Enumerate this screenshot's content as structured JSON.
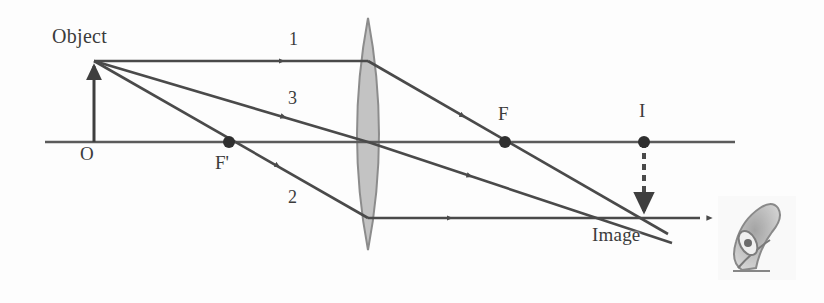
{
  "figure": {
    "background_color": "#fdfdfd",
    "ink_color": "#4a4a4a",
    "lens_fill_color": "#b8b8b8"
  },
  "labels": {
    "object": "Object",
    "optical_center": "O",
    "near_focal_point": "F'",
    "far_focal_point": "F",
    "image_point_on_axis": "I",
    "image": "Image",
    "ray1": "1",
    "ray2": "2",
    "ray3": "3"
  },
  "geometry": {
    "principal_axis": {
      "x1": 45,
      "y1": 142,
      "x2": 735,
      "y2": 142
    },
    "object_arrow": {
      "x": 94,
      "base_y": 142,
      "tip_y": 61
    },
    "image_arrow": {
      "x": 644,
      "base_y": 142,
      "tip_y": 216,
      "style": "dashed"
    },
    "lens": {
      "center_x": 368,
      "top_y": 18,
      "bottom_y": 250,
      "half_width": 22
    },
    "points": [
      {
        "name": "O",
        "x": 94,
        "y": 142
      },
      {
        "name": "F'",
        "x": 229,
        "y": 142
      },
      {
        "name": "F",
        "x": 505,
        "y": 142
      },
      {
        "name": "I",
        "x": 644,
        "y": 142
      }
    ],
    "rays": [
      {
        "id": "1",
        "description": "parallel to axis then refracted through far focal point F",
        "points": [
          [
            94,
            61
          ],
          [
            368,
            61
          ],
          [
            668,
            234
          ]
        ]
      },
      {
        "id": "3",
        "description": "through optical center, undeviated",
        "points": [
          [
            94,
            61
          ],
          [
            368,
            142
          ],
          [
            672,
            243
          ]
        ]
      },
      {
        "id": "2",
        "description": "through near focal point F' then refracted parallel to axis",
        "points": [
          [
            94,
            61
          ],
          [
            368,
            218
          ],
          [
            700,
            218
          ]
        ]
      }
    ],
    "eye": {
      "x": 730,
      "y": 203,
      "width": 62,
      "height": 70
    }
  }
}
